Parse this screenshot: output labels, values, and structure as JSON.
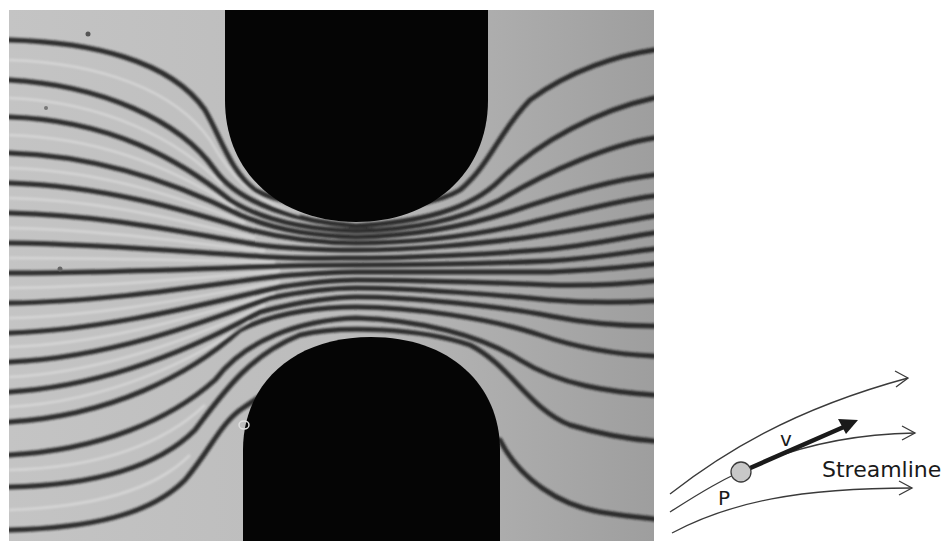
{
  "figure": {
    "photo": {
      "description": "Flow visualization photograph: streamlines passing through a constriction between two dark rounded obstacles",
      "colors": {
        "fluid": "#b9b9b9",
        "obstacle": "#050505",
        "streak": "#1e1e1e"
      }
    },
    "schematic": {
      "label_streamline": "Streamline",
      "label_point": "P",
      "label_velocity": "v",
      "colors": {
        "line": "#3a3a3a",
        "arrow": "#1a1a1a",
        "point_fill": "#c8c8c8"
      }
    }
  }
}
